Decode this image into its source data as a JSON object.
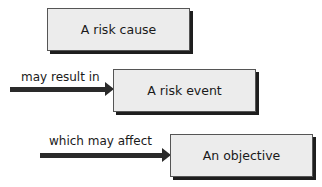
{
  "diagram": {
    "nodes": [
      {
        "id": "cause",
        "label": "A risk cause"
      },
      {
        "id": "event",
        "label": "A risk event"
      },
      {
        "id": "objective",
        "label": "An objective"
      }
    ],
    "edges": [
      {
        "from": "cause",
        "to": "event",
        "label": "may result in"
      },
      {
        "from": "event",
        "to": "objective",
        "label": "which may affect"
      }
    ],
    "colors": {
      "box_fill": "#ececec",
      "box_border": "#555555",
      "shadow": "#1e1e1e",
      "arrow": "#2a2a2a"
    }
  }
}
